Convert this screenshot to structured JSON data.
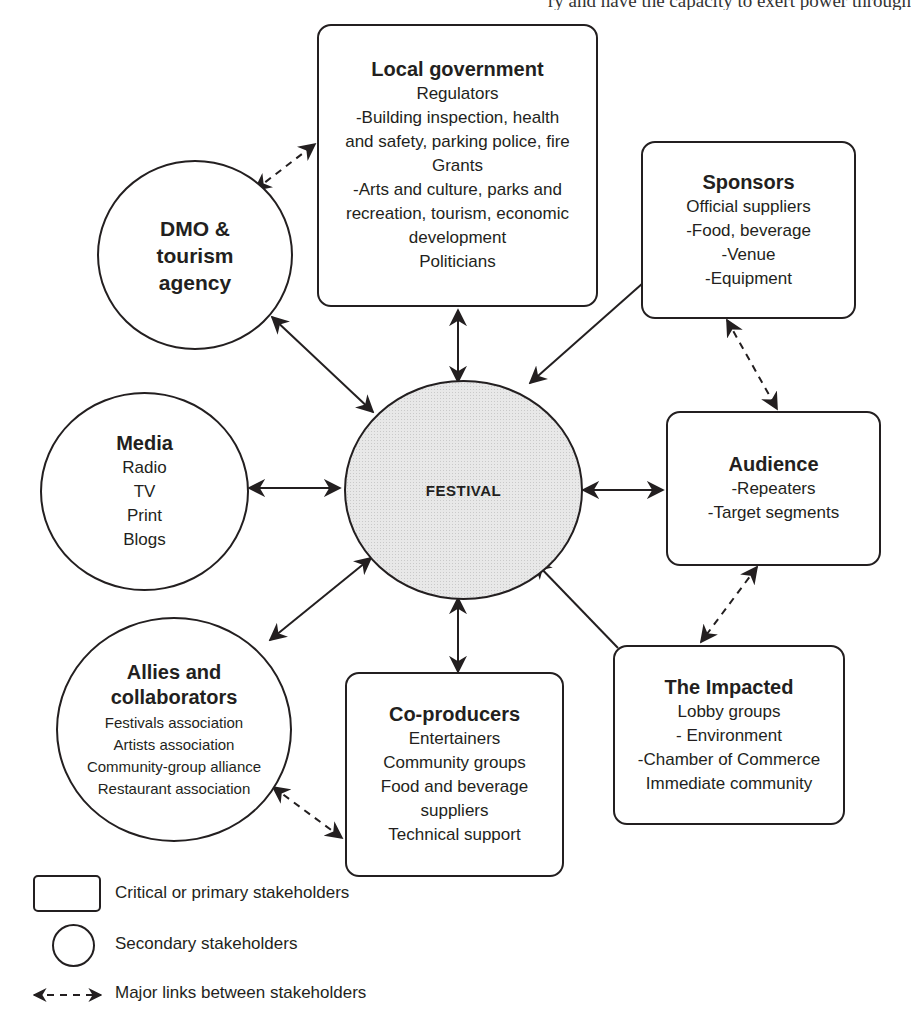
{
  "header": {
    "cutoff_text": "ry and have the capacity to exert power through"
  },
  "center": {
    "label": "FESTIVAL"
  },
  "nodes": {
    "local_government": {
      "title": "Local government",
      "lines": [
        "Regulators",
        "-Building inspection, health",
        "and safety, parking police, fire",
        "Grants",
        "-Arts and culture, parks and",
        "recreation, tourism, economic",
        "development",
        "Politicians"
      ],
      "shape": "box"
    },
    "sponsors": {
      "title": "Sponsors",
      "lines": [
        "Official suppliers",
        "-Food, beverage",
        "-Venue",
        "-Equipment"
      ],
      "shape": "box"
    },
    "audience": {
      "title": "Audience",
      "lines": [
        "-Repeaters",
        "-Target segments"
      ],
      "shape": "box"
    },
    "impacted": {
      "title": "The Impacted",
      "lines": [
        "Lobby groups",
        "- Environment",
        "-Chamber of Commerce",
        "Immediate community"
      ],
      "shape": "box"
    },
    "co_producers": {
      "title": "Co-producers",
      "lines": [
        "Entertainers",
        "Community groups",
        "Food and beverage",
        "suppliers",
        "Technical support"
      ],
      "shape": "box"
    },
    "allies": {
      "title": "Allies and collaborators",
      "title_lines": [
        "Allies and",
        "collaborators"
      ],
      "lines": [
        "Festivals association",
        "Artists association",
        "Community-group alliance",
        "Restaurant association"
      ],
      "shape": "circle"
    },
    "media": {
      "title": "Media",
      "lines": [
        "Radio",
        "TV",
        "Print",
        "Blogs"
      ],
      "shape": "circle"
    },
    "dmo": {
      "title": "DMO & tourism agency",
      "title_lines": [
        "DMO &",
        "tourism",
        "agency"
      ],
      "lines": [],
      "shape": "circle"
    }
  },
  "links": {
    "solid": [
      {
        "from": "Local government",
        "to": "FESTIVAL",
        "direction": "both"
      },
      {
        "from": "Sponsors",
        "to": "FESTIVAL",
        "direction": "to"
      },
      {
        "from": "Audience",
        "to": "FESTIVAL",
        "direction": "both"
      },
      {
        "from": "The Impacted",
        "to": "FESTIVAL",
        "direction": "to"
      },
      {
        "from": "Co-producers",
        "to": "FESTIVAL",
        "direction": "both"
      },
      {
        "from": "Allies and collaborators",
        "to": "FESTIVAL",
        "direction": "both"
      },
      {
        "from": "Media",
        "to": "FESTIVAL",
        "direction": "both"
      },
      {
        "from": "DMO & tourism agency",
        "to": "FESTIVAL",
        "direction": "both"
      }
    ],
    "dashed": [
      {
        "from": "DMO & tourism agency",
        "to": "Local government"
      },
      {
        "from": "Sponsors",
        "to": "Audience"
      },
      {
        "from": "Audience",
        "to": "The Impacted"
      },
      {
        "from": "Allies and collaborators",
        "to": "Co-producers"
      }
    ]
  },
  "legend": {
    "items": [
      {
        "symbol": "rounded-rectangle",
        "label": "Critical or primary stakeholders"
      },
      {
        "symbol": "circle",
        "label": "Secondary stakeholders"
      },
      {
        "symbol": "dashed-double-arrow",
        "label": "Major links between stakeholders"
      }
    ]
  },
  "colors": {
    "stroke": "#231f20",
    "festival_fill": "#e8e8e8",
    "background": "#ffffff"
  }
}
